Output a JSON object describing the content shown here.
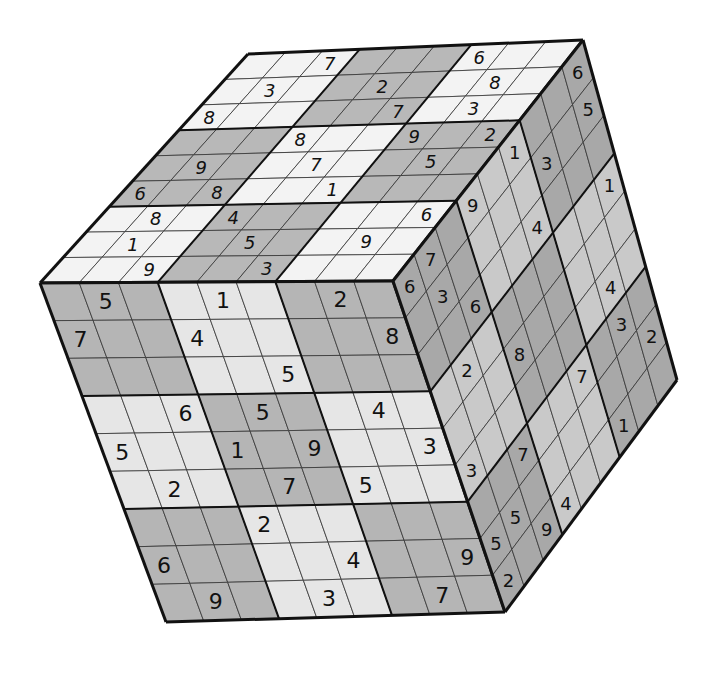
{
  "colors": {
    "background": "#ffffff",
    "light_cell": "#ececec",
    "dark_cell": "#b4b4b4",
    "top_light": "#f4f4f4",
    "top_dark": "#b9b9b9",
    "right_light": "#c8c8c8",
    "right_dark": "#a9a9a9",
    "grid_thin": "#333333",
    "grid_thick": "#111111"
  },
  "faces": {
    "front": {
      "corners": {
        "tl": [
          40,
          283
        ],
        "tr": [
          393,
          281
        ],
        "br": [
          505,
          612
        ],
        "bl": [
          166,
          622
        ]
      },
      "shade": {
        "light": "#e6e6e6",
        "dark": "#b5b5b5"
      },
      "dark_boxes": [
        [
          0,
          0
        ],
        [
          0,
          2
        ],
        [
          1,
          1
        ],
        [
          2,
          0
        ],
        [
          2,
          2
        ]
      ],
      "digit_size": 22,
      "italic": false,
      "grid": [
        [
          0,
          5,
          0,
          0,
          1,
          0,
          0,
          2,
          0
        ],
        [
          7,
          0,
          0,
          4,
          0,
          0,
          0,
          0,
          8
        ],
        [
          0,
          0,
          0,
          0,
          0,
          5,
          0,
          0,
          0
        ],
        [
          0,
          0,
          6,
          0,
          5,
          0,
          0,
          4,
          0
        ],
        [
          5,
          0,
          0,
          1,
          0,
          9,
          0,
          0,
          3
        ],
        [
          0,
          2,
          0,
          0,
          7,
          0,
          5,
          0,
          0
        ],
        [
          0,
          0,
          0,
          2,
          0,
          0,
          0,
          0,
          0
        ],
        [
          6,
          0,
          0,
          0,
          0,
          4,
          0,
          0,
          9
        ],
        [
          0,
          9,
          0,
          0,
          3,
          0,
          0,
          7,
          0
        ]
      ]
    },
    "top": {
      "corners": {
        "tl": [
          248,
          54
        ],
        "tr": [
          583,
          40
        ],
        "br": [
          393,
          281
        ],
        "bl": [
          40,
          283
        ]
      },
      "shade": {
        "light": "#f3f3f3",
        "dark": "#b8b8b8"
      },
      "dark_boxes": [
        [
          0,
          1
        ],
        [
          1,
          0
        ],
        [
          1,
          2
        ],
        [
          2,
          1
        ]
      ],
      "digit_size": 18,
      "italic": true,
      "grid": [
        [
          0,
          0,
          7,
          0,
          0,
          0,
          6,
          0,
          0
        ],
        [
          0,
          3,
          0,
          0,
          2,
          0,
          0,
          8,
          0
        ],
        [
          8,
          0,
          0,
          0,
          0,
          7,
          0,
          3,
          0
        ],
        [
          0,
          0,
          0,
          8,
          0,
          0,
          9,
          0,
          2
        ],
        [
          0,
          9,
          0,
          0,
          7,
          0,
          0,
          5,
          0
        ],
        [
          6,
          0,
          8,
          0,
          0,
          1,
          0,
          0,
          0
        ],
        [
          0,
          8,
          0,
          4,
          0,
          0,
          0,
          0,
          6
        ],
        [
          0,
          1,
          0,
          0,
          5,
          0,
          0,
          9,
          0
        ],
        [
          0,
          0,
          9,
          0,
          0,
          3,
          0,
          0,
          0
        ]
      ]
    },
    "right": {
      "corners": {
        "tl": [
          393,
          281
        ],
        "tr": [
          583,
          40
        ],
        "br": [
          677,
          380
        ],
        "bl": [
          505,
          612
        ]
      },
      "shade": {
        "light": "#c9c9c9",
        "dark": "#a8a8a8"
      },
      "dark_boxes": [
        [
          0,
          0
        ],
        [
          0,
          2
        ],
        [
          1,
          1
        ],
        [
          2,
          0
        ],
        [
          2,
          2
        ]
      ],
      "digit_size": 18,
      "italic": false,
      "grid": [
        [
          6,
          7,
          0,
          9,
          0,
          1,
          0,
          0,
          6
        ],
        [
          0,
          3,
          0,
          0,
          0,
          0,
          3,
          0,
          5
        ],
        [
          0,
          0,
          6,
          0,
          0,
          4,
          0,
          0,
          0
        ],
        [
          0,
          2,
          0,
          0,
          0,
          0,
          0,
          0,
          1
        ],
        [
          0,
          0,
          0,
          8,
          0,
          0,
          0,
          0,
          0
        ],
        [
          3,
          0,
          0,
          0,
          0,
          0,
          0,
          4,
          0
        ],
        [
          0,
          0,
          7,
          0,
          0,
          7,
          0,
          3,
          0
        ],
        [
          5,
          5,
          0,
          0,
          0,
          0,
          0,
          0,
          2
        ],
        [
          2,
          0,
          9,
          4,
          0,
          0,
          1,
          0,
          0
        ]
      ]
    }
  }
}
